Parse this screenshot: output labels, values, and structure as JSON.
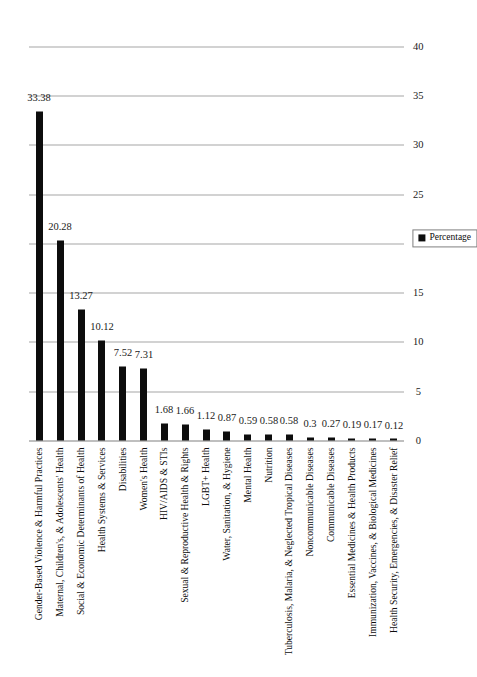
{
  "chart_data": {
    "type": "bar",
    "title": "",
    "subtitle": "",
    "xlabel": "",
    "ylabel": "Percentage",
    "ylim": [
      0,
      40
    ],
    "ytick_step": 5,
    "yticks": [
      "0",
      "5",
      "10",
      "15",
      "20",
      "25",
      "30",
      "35",
      "40"
    ],
    "grid": true,
    "orientation": "vertical-rotated",
    "legend": {
      "position": "right",
      "entries": [
        {
          "label": "Percentage",
          "color": "#0d0d0d"
        }
      ]
    },
    "series": [
      {
        "name": "Percentage",
        "color": "#0d0d0d",
        "values": [
          33.38,
          20.28,
          13.27,
          10.12,
          7.52,
          7.31,
          1.68,
          1.66,
          1.12,
          0.87,
          0.59,
          0.58,
          0.58,
          0.3,
          0.27,
          0.19,
          0.17,
          0.12
        ]
      }
    ],
    "categories": [
      "Gender-Based Violence & Harmful Practices",
      "Maternal, Children's, & Adolescents' Health",
      "Social & Economic Determinants of Health",
      "Health Systems & Services",
      "Disabilities",
      "Women's Health",
      "HIV/AIDS & STIs",
      "Sexual & Reproductive Health & Rights",
      "LGBT+ Health",
      "Water, Sanitation, & Hygiene",
      "Mental Health",
      "Nutrition",
      "Tuberculosis, Malaria, & Neglected Tropical Diseases",
      "Noncommunicable Diseases",
      "Communicable Diseases",
      "Essential Medicines & Health Products",
      "Immunization, Vaccines, & Biological Medicines",
      "Health Security, Emergencies, & Disaster Relief"
    ],
    "data_labels": [
      "33.38",
      "20.28",
      "13.27",
      "10.12",
      "7.52",
      "7.31",
      "1.68",
      "1.66",
      "1.12",
      "0.87",
      "0.59",
      "0.58",
      "0.58",
      "0.3",
      "0.27",
      "0.19",
      "0.17",
      "0.12"
    ],
    "colors": {
      "bar": "#0d0d0d",
      "gridline": "#a6a6a6",
      "axis": "#808080",
      "text": "#0d0d0d",
      "background": "#ffffff"
    }
  }
}
